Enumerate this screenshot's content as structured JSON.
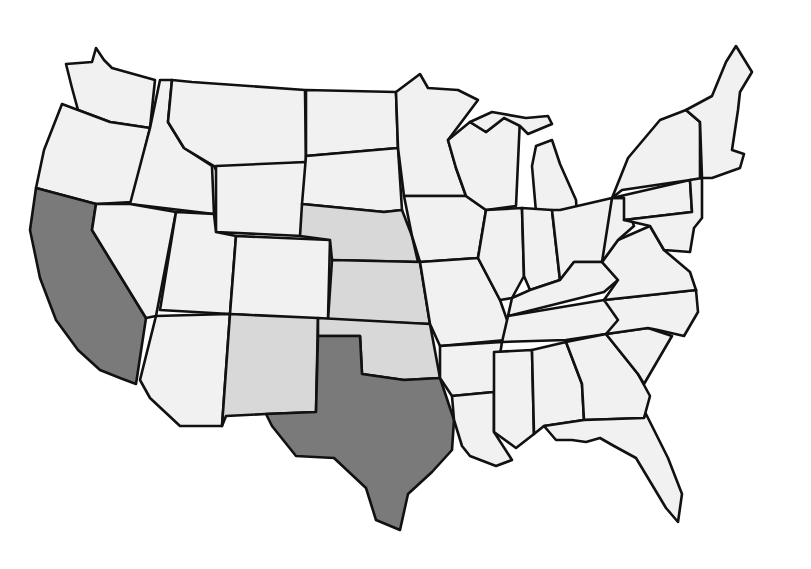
{
  "map": {
    "title": "United States map (hand-drawn, grayscale)",
    "colors": {
      "highlight": "#7a7a7a",
      "light_shade": "#d8d8d8",
      "default": "#f1f1f1",
      "border": "#111111",
      "background": "#ffffff"
    },
    "highlighted_states": [
      "California",
      "Texas"
    ],
    "lightly_shaded_states": [
      "New Mexico",
      "Oklahoma",
      "Kansas",
      "Nebraska"
    ],
    "labels_visible": false
  },
  "states": [
    {
      "name": "Washington",
      "shade": "default",
      "points": "66,64 92,62 96,48 104,60 112,68 155,80 150,128 110,122 78,110 72,88"
    },
    {
      "name": "Oregon",
      "shade": "default",
      "points": "62,104 78,110 110,122 150,128 132,202 96,204 36,188 44,150"
    },
    {
      "name": "California",
      "shade": "highlight",
      "points": "36,188 96,204 92,230 146,318 136,384 120,378 100,370 78,350 56,320 40,278 30,230"
    },
    {
      "name": "Idaho",
      "shade": "default",
      "points": "160,80 172,80 168,122 184,148 212,166 214,214 130,204 150,128"
    },
    {
      "name": "Nevada",
      "shade": "default",
      "points": "96,204 130,204 176,212 156,316 146,318 92,230"
    },
    {
      "name": "Montana",
      "shade": "default",
      "points": "172,80 192,82 305,90 306,162 216,170 214,166 184,148 168,122"
    },
    {
      "name": "Wyoming",
      "shade": "default",
      "points": "216,166 306,162 302,236 216,232"
    },
    {
      "name": "Utah",
      "shade": "default",
      "points": "176,212 214,214 216,232 236,236 230,314 160,310"
    },
    {
      "name": "Arizona",
      "shade": "default",
      "points": "156,316 230,314 222,426 180,426 150,398 140,380"
    },
    {
      "name": "Colorado",
      "shade": "default",
      "points": "236,236 330,240 328,320 230,314"
    },
    {
      "name": "New Mexico",
      "shade": "light",
      "points": "230,314 318,318 316,412 266,414 226,416 222,426"
    },
    {
      "name": "North Dakota",
      "shade": "default",
      "points": "306,90 396,92 398,148 306,156"
    },
    {
      "name": "South Dakota",
      "shade": "default",
      "points": "306,156 398,148 402,210 384,212 302,204"
    },
    {
      "name": "Nebraska",
      "shade": "light",
      "points": "302,204 384,212 402,210 412,236 418,262 332,260 330,240 300,236"
    },
    {
      "name": "Kansas",
      "shade": "light",
      "points": "332,260 420,262 430,324 328,320"
    },
    {
      "name": "Oklahoma",
      "shade": "light",
      "points": "318,318 430,324 440,378 404,380 362,374 360,336 318,336"
    },
    {
      "name": "Texas",
      "shade": "highlight",
      "points": "318,336 360,336 362,374 404,380 440,378 454,420 452,450 432,472 408,494 400,530 376,520 366,488 334,458 296,456 272,426 266,414 316,412"
    },
    {
      "name": "Minnesota",
      "shade": "default",
      "points": "396,92 420,74 428,88 458,90 478,100 448,140 456,168 466,196 404,196 398,148"
    },
    {
      "name": "Iowa",
      "shade": "default",
      "points": "404,196 466,196 486,210 478,258 420,262 412,236"
    },
    {
      "name": "Missouri",
      "shade": "default",
      "points": "420,262 478,258 500,300 512,334 506,340 440,346 430,324"
    },
    {
      "name": "Arkansas",
      "shade": "default",
      "points": "440,346 502,342 494,392 452,396 440,378"
    },
    {
      "name": "Louisiana",
      "shade": "default",
      "points": "452,396 494,392 494,432 512,460 496,466 470,456 462,446 454,420"
    },
    {
      "name": "Wisconsin",
      "shade": "default",
      "points": "448,140 470,122 486,132 504,118 520,118 516,206 486,210 466,196 456,168"
    },
    {
      "name": "Illinois",
      "shade": "default",
      "points": "486,210 522,208 524,276 512,298 500,300 478,258"
    },
    {
      "name": "Michigan",
      "shade": "default",
      "points": "532,166 536,146 552,140 560,164 576,200 578,232 548,234 536,212"
    },
    {
      "name": "Michigan Upper",
      "shade": "default",
      "points": "470,122 492,112 526,118 548,116 552,124 528,134 520,126 504,118 486,132"
    },
    {
      "name": "Indiana",
      "shade": "default",
      "points": "522,208 552,210 560,280 530,290 524,276"
    },
    {
      "name": "Ohio",
      "shade": "default",
      "points": "560,210 612,198 618,240 602,262 574,262 560,280 552,210"
    },
    {
      "name": "Kentucky",
      "shade": "default",
      "points": "512,298 530,290 560,280 574,262 602,262 618,280 604,292 508,316"
    },
    {
      "name": "Tennessee",
      "shade": "default",
      "points": "508,316 604,300 696,290 684,318 606,334 566,340 502,342"
    },
    {
      "name": "Mississippi",
      "shade": "default",
      "points": "494,352 532,350 534,434 516,448 494,432"
    },
    {
      "name": "Alabama",
      "shade": "default",
      "points": "532,350 566,342 582,384 584,420 544,426 534,434"
    },
    {
      "name": "Georgia",
      "shade": "default",
      "points": "566,342 606,334 638,374 650,396 644,418 584,420 582,384"
    },
    {
      "name": "Florida",
      "shade": "default",
      "points": "544,426 584,420 644,418 646,414 668,458 682,494 678,522 666,508 648,478 636,458 614,446 600,438 586,442 572,440 556,440"
    },
    {
      "name": "South Carolina",
      "shade": "default",
      "points": "606,334 648,328 672,336 644,384 638,374"
    },
    {
      "name": "North Carolina",
      "shade": "default",
      "points": "604,300 696,290 698,312 684,336 658,330 648,328 606,334 618,320"
    },
    {
      "name": "Virginia",
      "shade": "default",
      "points": "602,262 618,240 650,226 664,250 690,272 696,290 604,300 618,280"
    },
    {
      "name": "West Virginia",
      "shade": "default",
      "points": "612,198 624,198 634,226 618,240 602,262"
    },
    {
      "name": "Pennsylvania",
      "shade": "default",
      "points": "612,198 690,180 692,212 624,220 624,198"
    },
    {
      "name": "New York",
      "shade": "default",
      "points": "612,198 628,158 660,120 686,110 700,122 700,180 690,180 622,190"
    },
    {
      "name": "New England",
      "shade": "default",
      "points": "686,110 712,96 726,62 736,46 752,72 740,92 738,110 732,150 744,154 740,168 712,178 702,178 700,122"
    },
    {
      "name": "Mid-Atlantic",
      "shade": "default",
      "points": "690,180 702,178 702,218 694,228 690,252 664,250 650,226 624,220 692,212"
    }
  ]
}
